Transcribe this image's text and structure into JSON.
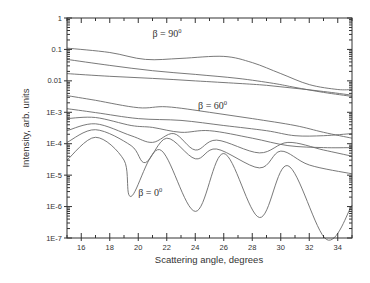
{
  "chart_data": {
    "type": "line",
    "title": "",
    "xlabel": "Scattering angle, degrees",
    "ylabel": "Intensity, arb. units",
    "xlim": [
      15,
      35
    ],
    "ylim": [
      1e-07,
      1
    ],
    "yscale": "log",
    "grid": false,
    "legend": null,
    "x_ticks": [
      "16",
      "18",
      "20",
      "22",
      "24",
      "26",
      "28",
      "30",
      "32",
      "34"
    ],
    "y_ticks": [
      "1",
      "0.1",
      "0.01",
      "1E-3",
      "1E-4",
      "1E-5",
      "1E-6",
      "1E-7"
    ],
    "annotations": [
      {
        "text": "β = 90",
        "sup": "0",
        "x": 21.0,
        "y": 0.25
      },
      {
        "text": "β = 60",
        "sup": "0",
        "x": 24.2,
        "y": 0.0013
      },
      {
        "text": "β = 0",
        "sup": "0",
        "x": 20.0,
        "y": 2.2e-06
      }
    ],
    "series": [
      {
        "name": "beta=90",
        "x": [
          15,
          18,
          20.5,
          23,
          26,
          28,
          30,
          32,
          34,
          35
        ],
        "y": [
          0.11,
          0.08,
          0.048,
          0.052,
          0.06,
          0.038,
          0.017,
          0.0076,
          0.0053,
          0.0053
        ]
      },
      {
        "name": "curve-2",
        "x": [
          15,
          18,
          21,
          24,
          27,
          29.5,
          31,
          33,
          35
        ],
        "y": [
          0.048,
          0.031,
          0.021,
          0.016,
          0.012,
          0.0083,
          0.0062,
          0.0043,
          0.0032
        ]
      },
      {
        "name": "curve-3",
        "x": [
          15,
          18,
          21,
          24,
          27,
          29,
          31,
          33,
          35
        ],
        "y": [
          0.017,
          0.014,
          0.012,
          0.01,
          0.0083,
          0.0072,
          0.0058,
          0.0046,
          0.0035
        ]
      },
      {
        "name": "beta=60",
        "x": [
          15,
          17,
          20,
          22,
          25,
          28,
          31,
          33,
          35
        ],
        "y": [
          0.0034,
          0.0024,
          0.0014,
          0.0015,
          0.001,
          0.00063,
          0.00038,
          0.00023,
          0.00015
        ]
      },
      {
        "name": "curve-5",
        "x": [
          15,
          17,
          20,
          23,
          26,
          29,
          31,
          33,
          35
        ],
        "y": [
          0.0013,
          0.00098,
          0.00063,
          0.00055,
          0.00038,
          0.00026,
          0.00018,
          0.00018,
          0.00021
        ]
      },
      {
        "name": "curve-6",
        "x": [
          15,
          17,
          19.5,
          21,
          23,
          25,
          28,
          30.5,
          33,
          35
        ],
        "y": [
          0.00063,
          0.00068,
          0.00038,
          0.00033,
          0.00023,
          0.00026,
          0.00015,
          8.7e-05,
          7.5e-05,
          7.5e-05
        ]
      },
      {
        "name": "curve-7",
        "x": [
          15,
          17,
          19.5,
          21,
          22.5,
          24,
          25.5,
          28.5,
          30.5,
          33,
          35
        ],
        "y": [
          0.00026,
          0.00043,
          0.00018,
          0.00011,
          0.00021,
          6.3e-05,
          0.00013,
          5.1e-05,
          0.00011,
          6.3e-05,
          4e-05
        ]
      },
      {
        "name": "curve-8",
        "x": [
          15,
          17,
          19.5,
          20.5,
          22,
          24,
          25.5,
          28.5,
          30,
          32,
          35
        ],
        "y": [
          0.00011,
          0.00028,
          8.7e-05,
          2.5e-05,
          0.00015,
          3.3e-05,
          6.8e-05,
          1.7e-05,
          5.8e-05,
          2.1e-05,
          1.1e-05
        ]
      },
      {
        "name": "beta=0",
        "x": [
          15,
          17,
          19,
          19.5,
          21.5,
          24,
          26,
          28.5,
          30.5,
          33.2,
          35
        ],
        "y": [
          3e-05,
          0.00016,
          3e-05,
          2.1e-06,
          6.5e-05,
          7e-07,
          4.9e-05,
          4.5e-07,
          2e-05,
          9e-08,
          1.1e-06
        ]
      }
    ]
  }
}
